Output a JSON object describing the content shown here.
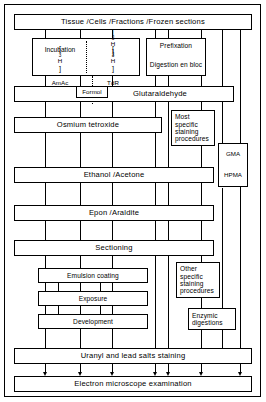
{
  "figure": {
    "line_color": "#000000",
    "background_color": "#ffffff"
  },
  "nodes": {
    "start": "Tissue /Cells /Fractions /Frozen sections",
    "incubation": "Incubation",
    "am_ac": "[3H] AmAc",
    "udr": "[3H] UdR",
    "tdr": "[3H] TdR",
    "prefixation": "Prefixation",
    "digestion_en_bloc": "Digestion en bloc",
    "formol": "Formol",
    "glutaraldehyde": "Glutaraldehyde",
    "osmium": "Osmium tetroxide",
    "most_specific_staining": "Most specific staining procedures",
    "gma": "GMA",
    "hpma": "HPMA",
    "ethanol_acetone": "Ethanol /Acetone",
    "epon_araldite": "Epon /Araldite",
    "sectioning": "Sectioning",
    "emulsion_coating": "Emulsion coating",
    "exposure": "Exposure",
    "development": "Development",
    "other_specific_staining": "Other specific staining procedures",
    "enzymic_digestions": "Enzymic digestions",
    "uranyl_lead": "Uranyl and lead salts staining",
    "electron_microscope": "Electron microscope examination"
  },
  "isotope_labels": {
    "mass_number": "3",
    "element": "H",
    "am_ac_name": "AmAc",
    "udr_name": "UdR",
    "tdr_name": "TdR",
    "bracket_open": "[",
    "bracket_close": "]"
  }
}
